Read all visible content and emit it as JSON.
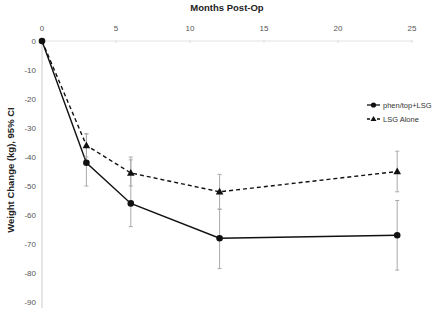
{
  "chart_data": {
    "type": "line",
    "title": "Months Post-Op",
    "xlabel": "Months Post-Op",
    "ylabel": "Weight Change (kg), 95% CI",
    "x_axis_position": "top",
    "xlim": [
      0,
      25
    ],
    "ylim": [
      -90,
      0
    ],
    "xticks": [
      0,
      5,
      10,
      15,
      20,
      25
    ],
    "yticks": [
      0,
      -10,
      -20,
      -30,
      -40,
      -50,
      -60,
      -70,
      -80,
      -90
    ],
    "grid": false,
    "legend_position": "right",
    "x": [
      0,
      3,
      6,
      12,
      24
    ],
    "series": [
      {
        "name": "phen/top+LSG",
        "marker": "circle",
        "line": "solid",
        "values": [
          0,
          -42,
          -56,
          -68,
          -67
        ],
        "ci_low": [
          0,
          -50,
          -64,
          -78.5,
          -79
        ],
        "ci_high": [
          0,
          -32,
          -40,
          -58,
          -55
        ]
      },
      {
        "name": "LSG Alone",
        "marker": "triangle",
        "line": "dashed",
        "values": [
          0,
          -36,
          -45.5,
          -52,
          -45
        ],
        "ci_low": [
          0,
          -40,
          -50,
          -58,
          -52
        ],
        "ci_high": [
          0,
          -32,
          -41,
          -46,
          -38
        ]
      }
    ]
  },
  "labels": {
    "title": "Months Post-Op",
    "ylabel": "Weight Change (kg), 95% CI",
    "legend": [
      "phen/top+LSG",
      "LSG Alone"
    ]
  }
}
